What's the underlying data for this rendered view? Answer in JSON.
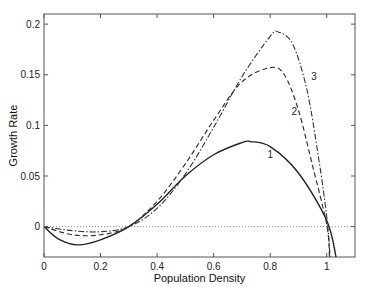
{
  "chart_data": {
    "type": "line",
    "title": "",
    "xlabel": "Population Density",
    "ylabel": "Growth Rate",
    "xlim": [
      0,
      1.1
    ],
    "ylim": [
      -0.03,
      0.21
    ],
    "grid": false,
    "legend": "none (curves labeled inline 1, 2, 3)",
    "x_ticks": [
      0,
      0.2,
      0.4,
      0.6,
      0.8,
      1
    ],
    "x_tick_labels": [
      "0",
      "0.2",
      "0.4",
      "0.6",
      "0.8",
      "1"
    ],
    "y_ticks": [
      0,
      0.05,
      0.1,
      0.15,
      0.2
    ],
    "y_tick_labels": [
      "0",
      "0.05",
      "0.1",
      "0.15",
      "0.2"
    ],
    "reference_line": {
      "y": 0,
      "style": "dotted",
      "color": "#888888"
    },
    "series": [
      {
        "name": "1",
        "style": "solid",
        "label_pos": [
          0.8,
          0.068
        ],
        "x": [
          0,
          0.05,
          0.12,
          0.2,
          0.3,
          0.4,
          0.5,
          0.6,
          0.7,
          0.73,
          0.8,
          0.9,
          1.0,
          1.033
        ],
        "y": [
          0,
          -0.012,
          -0.018,
          -0.013,
          0,
          0.022,
          0.05,
          0.071,
          0.083,
          0.084,
          0.079,
          0.053,
          0.006,
          -0.03
        ]
      },
      {
        "name": "2",
        "style": "dashed",
        "label_pos": [
          0.885,
          0.11
        ],
        "x": [
          0,
          0.1,
          0.2,
          0.3,
          0.4,
          0.5,
          0.6,
          0.7,
          0.8,
          0.85,
          0.9,
          0.95,
          1.0,
          1.01
        ],
        "y": [
          0,
          -0.008,
          -0.008,
          0,
          0.025,
          0.062,
          0.105,
          0.143,
          0.157,
          0.15,
          0.115,
          0.06,
          0.002,
          -0.03
        ]
      },
      {
        "name": "3",
        "style": "dashdot",
        "label_pos": [
          0.955,
          0.145
        ],
        "x": [
          0,
          0.1,
          0.2,
          0.3,
          0.4,
          0.5,
          0.6,
          0.7,
          0.8,
          0.83,
          0.88,
          0.93,
          0.97,
          1.0,
          1.012
        ],
        "y": [
          0,
          -0.004,
          -0.005,
          0,
          0.018,
          0.052,
          0.098,
          0.148,
          0.188,
          0.192,
          0.18,
          0.135,
          0.07,
          0.01,
          -0.03
        ]
      }
    ]
  },
  "layout": {
    "plot_left": 44,
    "plot_right": 355,
    "plot_top": 14,
    "plot_bottom": 257
  }
}
